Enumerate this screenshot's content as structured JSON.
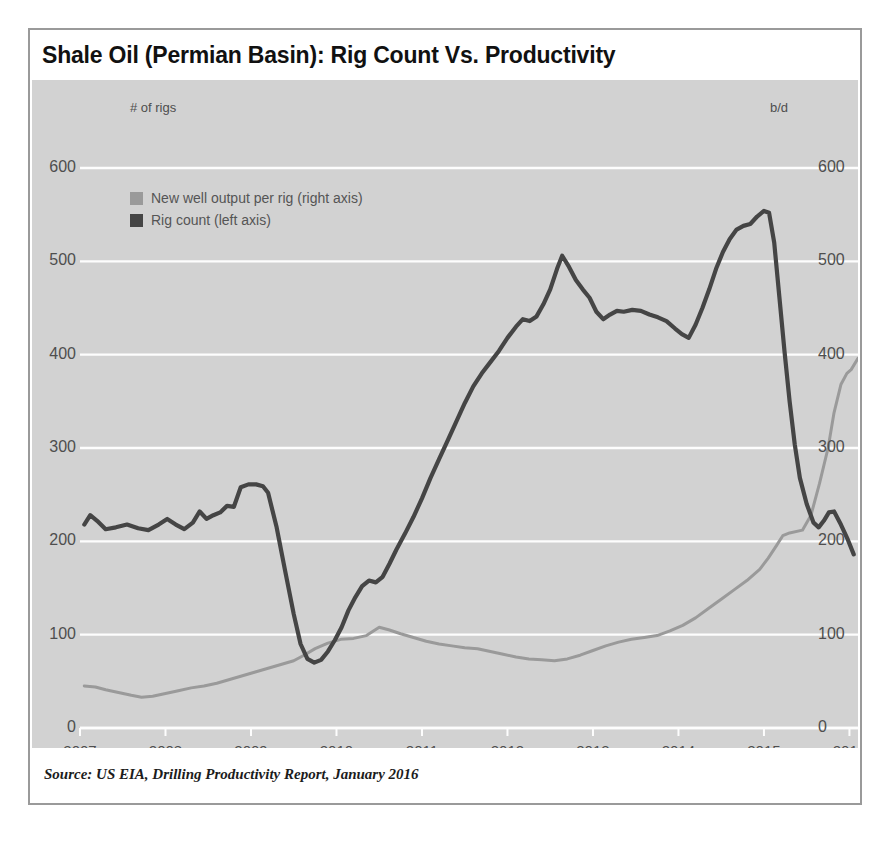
{
  "figure": {
    "title": "Shale Oil (Permian Basin): Rig Count Vs. Productivity",
    "source": "Source: US EIA, Drilling Productivity Report, January 2016",
    "left_axis_unit": "# of rigs",
    "right_axis_unit": "b/d"
  },
  "colors": {
    "plot_background": "#d2d2d2",
    "figure_background": "#ffffff",
    "gridline": "#fdfdfd",
    "rig_count_line": "#454545",
    "productivity_line": "#9a9a9a",
    "tick_text": "#4e4e4e",
    "title_text": "#111111",
    "border": "#9a9a9a"
  },
  "chart_data": {
    "type": "line",
    "title": "Shale Oil (Permian Basin): Rig Count Vs. Productivity",
    "xlabel": "",
    "ylabel": "# of rigs",
    "y2label": "b/d",
    "xlim": [
      2007.0,
      2016.1
    ],
    "ylim": [
      0,
      600
    ],
    "y2lim": [
      0,
      600
    ],
    "yticks": [
      0,
      100,
      200,
      300,
      400,
      500,
      600
    ],
    "y2ticks": [
      0,
      100,
      200,
      300,
      400,
      500,
      600
    ],
    "xticks": [
      2007,
      2008,
      2009,
      2010,
      2011,
      2012,
      2013,
      2014,
      2015,
      2016
    ],
    "grid": true,
    "legend_position": "upper-left",
    "series": [
      {
        "name": "New well output per rig (right axis)",
        "axis": "right",
        "color": "#9a9a9a",
        "points": [
          [
            2007.05,
            45
          ],
          [
            2007.18,
            44
          ],
          [
            2007.3,
            41
          ],
          [
            2007.45,
            38
          ],
          [
            2007.6,
            35
          ],
          [
            2007.72,
            33
          ],
          [
            2007.85,
            34
          ],
          [
            2008.0,
            37
          ],
          [
            2008.15,
            40
          ],
          [
            2008.3,
            43
          ],
          [
            2008.45,
            45
          ],
          [
            2008.6,
            48
          ],
          [
            2008.75,
            52
          ],
          [
            2008.9,
            56
          ],
          [
            2009.05,
            60
          ],
          [
            2009.2,
            64
          ],
          [
            2009.35,
            68
          ],
          [
            2009.5,
            72
          ],
          [
            2009.62,
            78
          ],
          [
            2009.75,
            85
          ],
          [
            2009.9,
            91
          ],
          [
            2010.05,
            95
          ],
          [
            2010.2,
            96
          ],
          [
            2010.35,
            99
          ],
          [
            2010.5,
            108
          ],
          [
            2010.62,
            105
          ],
          [
            2010.75,
            101
          ],
          [
            2010.9,
            97
          ],
          [
            2011.05,
            93
          ],
          [
            2011.2,
            90
          ],
          [
            2011.35,
            88
          ],
          [
            2011.5,
            86
          ],
          [
            2011.65,
            85
          ],
          [
            2011.8,
            82
          ],
          [
            2011.95,
            79
          ],
          [
            2012.1,
            76
          ],
          [
            2012.25,
            74
          ],
          [
            2012.4,
            73
          ],
          [
            2012.55,
            72
          ],
          [
            2012.7,
            74
          ],
          [
            2012.85,
            78
          ],
          [
            2013.0,
            83
          ],
          [
            2013.15,
            88
          ],
          [
            2013.3,
            92
          ],
          [
            2013.45,
            95
          ],
          [
            2013.6,
            97
          ],
          [
            2013.75,
            99
          ],
          [
            2013.9,
            104
          ],
          [
            2014.05,
            110
          ],
          [
            2014.2,
            118
          ],
          [
            2014.35,
            128
          ],
          [
            2014.5,
            138
          ],
          [
            2014.65,
            148
          ],
          [
            2014.8,
            158
          ],
          [
            2014.95,
            170
          ],
          [
            2015.05,
            182
          ],
          [
            2015.15,
            196
          ],
          [
            2015.22,
            206
          ],
          [
            2015.3,
            209
          ],
          [
            2015.45,
            212
          ],
          [
            2015.55,
            228
          ],
          [
            2015.65,
            262
          ],
          [
            2015.75,
            300
          ],
          [
            2015.82,
            338
          ],
          [
            2015.9,
            368
          ],
          [
            2015.97,
            380
          ],
          [
            2016.02,
            384
          ],
          [
            2016.1,
            396
          ]
        ]
      },
      {
        "name": "Rig count (left axis)",
        "axis": "left",
        "color": "#454545",
        "points": [
          [
            2007.05,
            218
          ],
          [
            2007.12,
            228
          ],
          [
            2007.2,
            222
          ],
          [
            2007.3,
            213
          ],
          [
            2007.42,
            215
          ],
          [
            2007.55,
            218
          ],
          [
            2007.68,
            214
          ],
          [
            2007.8,
            212
          ],
          [
            2007.92,
            218
          ],
          [
            2008.02,
            224
          ],
          [
            2008.12,
            218
          ],
          [
            2008.22,
            213
          ],
          [
            2008.32,
            220
          ],
          [
            2008.4,
            232
          ],
          [
            2008.48,
            224
          ],
          [
            2008.56,
            228
          ],
          [
            2008.64,
            231
          ],
          [
            2008.72,
            238
          ],
          [
            2008.8,
            237
          ],
          [
            2008.88,
            258
          ],
          [
            2008.97,
            261
          ],
          [
            2009.06,
            261
          ],
          [
            2009.14,
            259
          ],
          [
            2009.2,
            252
          ],
          [
            2009.3,
            215
          ],
          [
            2009.4,
            168
          ],
          [
            2009.5,
            122
          ],
          [
            2009.58,
            90
          ],
          [
            2009.66,
            74
          ],
          [
            2009.74,
            70
          ],
          [
            2009.82,
            73
          ],
          [
            2009.9,
            82
          ],
          [
            2009.98,
            94
          ],
          [
            2010.06,
            108
          ],
          [
            2010.14,
            126
          ],
          [
            2010.22,
            140
          ],
          [
            2010.3,
            152
          ],
          [
            2010.38,
            158
          ],
          [
            2010.46,
            156
          ],
          [
            2010.54,
            162
          ],
          [
            2010.62,
            176
          ],
          [
            2010.7,
            191
          ],
          [
            2010.8,
            208
          ],
          [
            2010.9,
            226
          ],
          [
            2011.0,
            246
          ],
          [
            2011.1,
            268
          ],
          [
            2011.2,
            288
          ],
          [
            2011.3,
            308
          ],
          [
            2011.4,
            328
          ],
          [
            2011.5,
            348
          ],
          [
            2011.6,
            366
          ],
          [
            2011.7,
            380
          ],
          [
            2011.8,
            392
          ],
          [
            2011.9,
            404
          ],
          [
            2012.0,
            418
          ],
          [
            2012.1,
            430
          ],
          [
            2012.18,
            438
          ],
          [
            2012.26,
            436
          ],
          [
            2012.34,
            441
          ],
          [
            2012.42,
            454
          ],
          [
            2012.5,
            470
          ],
          [
            2012.58,
            492
          ],
          [
            2012.64,
            506
          ],
          [
            2012.72,
            494
          ],
          [
            2012.8,
            480
          ],
          [
            2012.88,
            470
          ],
          [
            2012.96,
            461
          ],
          [
            2013.04,
            446
          ],
          [
            2013.12,
            438
          ],
          [
            2013.2,
            443
          ],
          [
            2013.28,
            447
          ],
          [
            2013.36,
            446
          ],
          [
            2013.46,
            448
          ],
          [
            2013.56,
            447
          ],
          [
            2013.66,
            443
          ],
          [
            2013.76,
            440
          ],
          [
            2013.86,
            436
          ],
          [
            2013.96,
            428
          ],
          [
            2014.04,
            422
          ],
          [
            2014.12,
            418
          ],
          [
            2014.2,
            432
          ],
          [
            2014.28,
            450
          ],
          [
            2014.36,
            470
          ],
          [
            2014.44,
            492
          ],
          [
            2014.52,
            510
          ],
          [
            2014.6,
            524
          ],
          [
            2014.68,
            534
          ],
          [
            2014.76,
            538
          ],
          [
            2014.84,
            540
          ],
          [
            2014.92,
            548
          ],
          [
            2015.0,
            554
          ],
          [
            2015.06,
            552
          ],
          [
            2015.12,
            520
          ],
          [
            2015.18,
            462
          ],
          [
            2015.24,
            404
          ],
          [
            2015.3,
            350
          ],
          [
            2015.36,
            304
          ],
          [
            2015.42,
            268
          ],
          [
            2015.5,
            240
          ],
          [
            2015.58,
            220
          ],
          [
            2015.64,
            215
          ],
          [
            2015.7,
            222
          ],
          [
            2015.76,
            231
          ],
          [
            2015.82,
            232
          ],
          [
            2015.9,
            218
          ],
          [
            2015.98,
            202
          ],
          [
            2016.05,
            186
          ]
        ]
      }
    ]
  }
}
